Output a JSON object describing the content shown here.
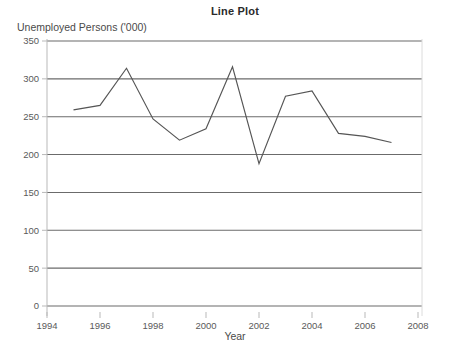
{
  "chart_data": {
    "type": "line",
    "title": "Line Plot",
    "xlabel": "Year",
    "ylabel": "Unemployed Persons ('000)",
    "x": [
      1995,
      1996,
      1997,
      1998,
      1999,
      2000,
      2001,
      2002,
      2003,
      2004,
      2005,
      2006,
      2007
    ],
    "values": [
      259,
      265,
      314,
      247,
      219,
      234,
      316,
      188,
      277,
      284,
      228,
      224,
      216
    ],
    "series": [
      {
        "name": "Unemployed Persons ('000)",
        "values": [
          259,
          265,
          314,
          247,
          219,
          234,
          316,
          188,
          277,
          284,
          228,
          224,
          216
        ]
      }
    ],
    "xlim": [
      1994,
      2008
    ],
    "ylim": [
      0,
      350
    ],
    "xticks": [
      1994,
      1996,
      1998,
      2000,
      2002,
      2004,
      2006,
      2008
    ],
    "xtick_labels": [
      "1994",
      "1996",
      "1998",
      "2000",
      "2002",
      "2004",
      "2006",
      "2008"
    ],
    "yticks": [
      0,
      50,
      100,
      150,
      200,
      250,
      300,
      350
    ],
    "ytick_labels": [
      "0",
      "50",
      "100",
      "150",
      "200",
      "250",
      "300",
      "350"
    ],
    "grid": "horizontal",
    "legend": "none",
    "line_color": "#555555",
    "grid_color": "#6b6b6b",
    "axis_color": "#b9b9b9",
    "background": "#ffffff"
  }
}
